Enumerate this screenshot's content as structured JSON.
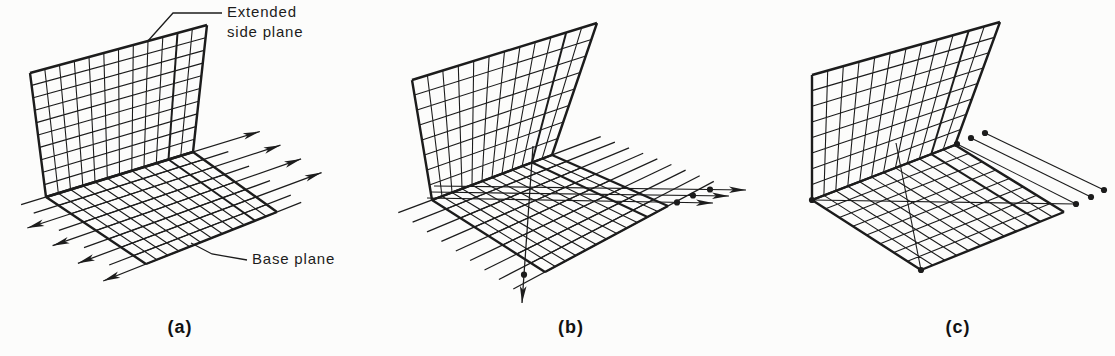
{
  "figure": {
    "background_color": "#fcfcfb",
    "ink_color": "#1c1c1c",
    "annotations": {
      "extended_side_plane": "Extended\nside plane",
      "base_plane": "Base plane"
    },
    "panels": [
      {
        "caption": "(a)"
      },
      {
        "caption": "(b)"
      },
      {
        "caption": "(c)"
      }
    ]
  }
}
